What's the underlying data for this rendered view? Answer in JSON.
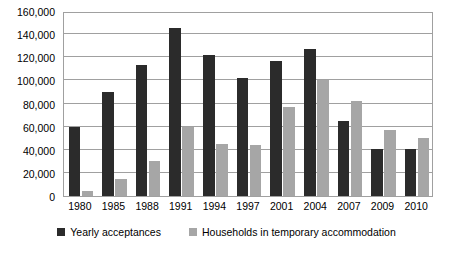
{
  "chart_data": {
    "type": "bar",
    "title": "",
    "subtitle": "",
    "xlabel": "",
    "ylabel": "",
    "categories": [
      "1980",
      "1985",
      "1988",
      "1991",
      "1994",
      "1997",
      "2001",
      "2004",
      "2007",
      "2009",
      "2010"
    ],
    "series": [
      {
        "name": "Yearly acceptances",
        "color": "#2b2b2b",
        "values": [
          60000,
          90000,
          113000,
          145000,
          122000,
          102000,
          117000,
          127000,
          65000,
          41000,
          41000
        ]
      },
      {
        "name": "Households in temporary accommodation",
        "color": "#a6a6a6",
        "values": [
          4000,
          15000,
          30000,
          60000,
          45000,
          44000,
          77000,
          100000,
          82000,
          57000,
          50000
        ]
      }
    ],
    "ylim": [
      0,
      160000
    ],
    "ytick_step": 20000,
    "ytick_labels": [
      "160,000",
      "140,000",
      "120,000",
      "100,000",
      "80,000",
      "60,000",
      "40,000",
      "20,000",
      "0"
    ],
    "ytick_values": [
      160000,
      140000,
      120000,
      100000,
      80000,
      60000,
      40000,
      20000,
      0
    ],
    "grid": true,
    "grid_axis": "y",
    "legend_position": "bottom",
    "colors": {
      "axis": "#a0a0a0",
      "background": "#ffffff",
      "text": "#000000",
      "series_dark": "#2b2b2b",
      "series_gray": "#a6a6a6"
    }
  },
  "legend": {
    "items": [
      {
        "label": "Yearly acceptances",
        "color": "#2b2b2b"
      },
      {
        "label": "Households in temporary accommodation",
        "color": "#a6a6a6"
      }
    ]
  }
}
